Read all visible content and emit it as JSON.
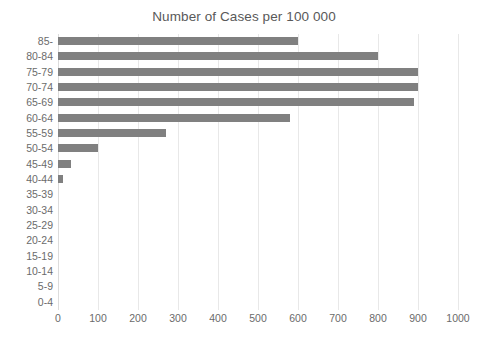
{
  "chart_data": {
    "type": "bar",
    "orientation": "horizontal",
    "title": "Number of Cases per 100 000",
    "xlabel": "",
    "ylabel": "",
    "xlim": [
      0,
      1000
    ],
    "ylim": null,
    "grid": true,
    "legend": null,
    "bar_color": "#808080",
    "gridline_color": "#e8e8e8",
    "text_color": "#595959",
    "xticks": [
      0,
      100,
      200,
      300,
      400,
      500,
      600,
      700,
      800,
      900,
      1000
    ],
    "xtick_labels": [
      "0",
      "100",
      "200",
      "300",
      "400",
      "500",
      "600",
      "700",
      "800",
      "900",
      "1000"
    ],
    "categories": [
      "85-",
      "80-84",
      "75-79",
      "70-74",
      "65-69",
      "60-64",
      "55-59",
      "50-54",
      "45-49",
      "40-44",
      "35-39",
      "30-34",
      "25-29",
      "20-24",
      "15-19",
      "10-14",
      "5-9",
      "0-4"
    ],
    "values": [
      600,
      800,
      900,
      900,
      890,
      580,
      270,
      100,
      32,
      12,
      0,
      0,
      0,
      0,
      0,
      0,
      0,
      0
    ]
  }
}
